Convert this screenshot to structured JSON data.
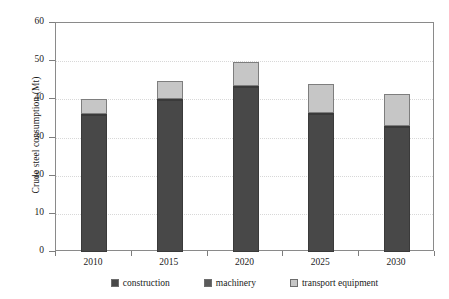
{
  "chart_data": {
    "type": "bar",
    "subtype": "stacked-vertical",
    "title": "",
    "xlabel": "",
    "ylabel": "Crude steel consumption (Mt)",
    "categories": [
      "2010",
      "2015",
      "2020",
      "2025",
      "2030"
    ],
    "ylim": [
      0,
      60
    ],
    "yticks": [
      0,
      10,
      20,
      30,
      40,
      50,
      60
    ],
    "ytick_labels": [
      "0",
      "10",
      "20",
      "30",
      "40",
      "50",
      "60"
    ],
    "grid": true,
    "grid_axis": "y",
    "legend_position": "bottom",
    "series": [
      {
        "name": "construction",
        "color": "#484848",
        "values": [
          36.0,
          40.0,
          43.2,
          36.2,
          32.8
        ]
      },
      {
        "name": "machinery",
        "color": "#5a5a5a",
        "values": [
          0.2,
          0.2,
          0.2,
          0.2,
          0.2
        ]
      },
      {
        "name": "transport equipment",
        "color": "#c6c6c6",
        "values": [
          3.8,
          4.5,
          6.4,
          7.6,
          8.5
        ]
      }
    ],
    "totals": [
      40.0,
      44.7,
      49.8,
      44.0,
      41.5
    ]
  },
  "legend": {
    "items": [
      {
        "label": "construction",
        "color": "#484848"
      },
      {
        "label": "machinery",
        "color": "#5a5a5a"
      },
      {
        "label": "transport equipment",
        "color": "#c6c6c6"
      }
    ]
  },
  "axes": {
    "y_title": "Crude steel consumption (Mt)"
  }
}
